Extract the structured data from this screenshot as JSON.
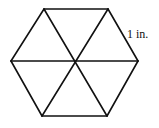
{
  "figure": {
    "shape": "regular hexagon divided into 6 equilateral triangles",
    "side_label": "1 in.",
    "side_length_value": 1,
    "side_length_unit": "in.",
    "triangle_count": 6
  }
}
